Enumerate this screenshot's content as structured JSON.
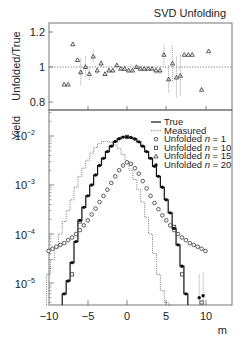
{
  "chart_data": [
    {
      "type": "scatter",
      "panel": "ratio",
      "title": "SVD Unfolding",
      "xlabel": "",
      "ylabel": "Unfolded/True",
      "ylim": [
        0.75,
        1.25
      ],
      "xlim": [
        -10,
        13.3
      ],
      "yticks": [
        "0.8",
        "1",
        "1.2"
      ],
      "reference_line": 1.0,
      "series": [
        {
          "name": "Unfolded n = 15 / True",
          "marker": "triangle",
          "x": [
            -8.0,
            -7.5,
            -6.9,
            -6.3,
            -5.9,
            -5.3,
            -4.8,
            -4.3,
            -3.8,
            -3.3,
            -2.8,
            -2.3,
            -1.8,
            -1.3,
            -0.8,
            -0.3,
            0.2,
            0.7,
            1.2,
            1.7,
            2.2,
            2.7,
            3.2,
            3.7,
            4.2,
            4.7,
            5.3,
            5.8,
            6.3,
            6.8,
            7.3,
            7.8,
            8.3,
            9.5,
            10.4
          ],
          "y": [
            0.9,
            0.9,
            1.13,
            1.04,
            0.97,
            1.0,
            0.96,
            1.06,
            0.98,
            1.02,
            0.96,
            0.98,
            0.98,
            1.01,
            0.99,
            0.99,
            0.98,
            0.98,
            1.0,
            0.99,
            0.99,
            0.99,
            0.99,
            0.98,
            0.98,
            1.07,
            0.93,
            1.02,
            0.94,
            0.95,
            1.07,
            1.07,
            1.07,
            0.87,
            1.09
          ],
          "err": [
            0,
            0,
            0,
            0,
            0.08,
            0.06,
            0.04,
            0.04,
            0.02,
            0.02,
            0.01,
            0.01,
            0.01,
            0.01,
            0.01,
            0.01,
            0.01,
            0.01,
            0.01,
            0.01,
            0.01,
            0.01,
            0.01,
            0.02,
            0.02,
            0.06,
            0.08,
            0.1,
            0.12,
            0.12,
            0,
            0,
            0,
            0,
            0
          ]
        }
      ]
    },
    {
      "type": "line",
      "panel": "yield",
      "title": "",
      "xlabel": "m",
      "ylabel": "Yield",
      "yscale": "log",
      "ylim": [
        3e-06,
        0.03
      ],
      "xlim": [
        -10,
        13.3
      ],
      "xticks": [
        "−10",
        "−5",
        "0",
        "5",
        "10"
      ],
      "yticks": [
        "10^-5",
        "10^-4",
        "10^-3",
        "10^-2"
      ],
      "legend_position": "upper right",
      "series": [
        {
          "name": "True",
          "style": "solid-step",
          "x": [
            -8.0,
            -7.5,
            -7.0,
            -6.5,
            -6.0,
            -5.5,
            -5.0,
            -4.5,
            -4.0,
            -3.5,
            -3.0,
            -2.5,
            -2.0,
            -1.5,
            -1.0,
            -0.5,
            0.0,
            0.5,
            1.0,
            1.5,
            2.0,
            2.5,
            3.0,
            3.5,
            4.0,
            4.5,
            5.0,
            5.5,
            6.0,
            6.5,
            7.0,
            7.5
          ],
          "values": [
            6e-06,
            1.1e-05,
            2.6e-05,
            7e-05,
            0.00019,
            0.00035,
            0.0006,
            0.001,
            0.0016,
            0.0025,
            0.0035,
            0.0048,
            0.0062,
            0.0077,
            0.0088,
            0.0095,
            0.0096,
            0.0093,
            0.0087,
            0.0076,
            0.0062,
            0.0048,
            0.0035,
            0.0024,
            0.0015,
            0.0009,
            0.0005,
            0.00027,
            0.00013,
            6e-05,
            2.2e-05,
            6e-06
          ]
        },
        {
          "name": "Measured",
          "style": "dotted-step",
          "x": [
            -10.0,
            -9.5,
            -9.0,
            -8.5,
            -8.0,
            -7.5,
            -7.0,
            -6.5,
            -6.0,
            -5.5,
            -5.0,
            -4.5,
            -4.0,
            -3.5,
            -3.0,
            -2.5,
            -2.0,
            -1.5,
            -1.0,
            -0.5,
            0.0,
            0.5,
            1.0,
            1.5,
            2.0,
            2.5,
            3.0,
            3.5,
            4.0,
            4.5,
            5.0,
            5.5
          ],
          "values": [
            1.5e-05,
            3e-05,
            5e-05,
            0.0001,
            0.00018,
            0.0003,
            0.0005,
            0.0009,
            0.0015,
            0.0022,
            0.0032,
            0.0045,
            0.0058,
            0.007,
            0.0077,
            0.0078,
            0.0074,
            0.0066,
            0.0055,
            0.0042,
            0.003,
            0.002,
            0.0013,
            0.0008,
            0.00045,
            0.00022,
            0.0001,
            4e-05,
            1.5e-05,
            7e-06,
            4e-06,
            3e-06
          ]
        },
        {
          "name": "Unfolded n = 1",
          "marker": "open-circle",
          "x": [
            -10.0,
            -9.5,
            -9.0,
            -8.5,
            -8.0,
            -7.5,
            -7.0,
            -6.5,
            -6.0,
            -5.5,
            -5.0,
            -4.5,
            -4.0,
            -3.5,
            -3.0,
            -2.5,
            -2.0,
            -1.5,
            -1.0,
            -0.5,
            0.0,
            0.5,
            1.0,
            1.5,
            2.0,
            2.5,
            3.0,
            3.5,
            4.0,
            4.5,
            5.0,
            5.5,
            6.0,
            6.5,
            7.0,
            7.5,
            8.0,
            8.5,
            9.0,
            9.5,
            10.0
          ],
          "values": [
            4.5e-05,
            5e-05,
            5.5e-05,
            6e-05,
            6.5e-05,
            7.5e-05,
            8.5e-05,
            0.0001,
            0.00012,
            0.00015,
            0.00019,
            0.00025,
            0.00033,
            0.00045,
            0.0006,
            0.0008,
            0.0011,
            0.0015,
            0.002,
            0.0025,
            0.0029,
            0.0027,
            0.0022,
            0.0017,
            0.0012,
            0.00085,
            0.0006,
            0.00043,
            0.00032,
            0.00024,
            0.00019,
            0.00015,
            0.00012,
            0.0001,
            8.5e-05,
            7.5e-05,
            6.5e-05,
            6e-05,
            5.5e-05,
            5e-05,
            4.5e-05
          ]
        },
        {
          "name": "Unfolded n = 10",
          "marker": "open-square",
          "x": [
            -7.0,
            -6.0,
            0.0,
            6.0,
            7.0,
            9.5
          ],
          "values": [
            1.5e-05,
            0.00018,
            0.0096,
            0.00014,
            1.5e-05,
            4e-06
          ]
        },
        {
          "name": "Unfolded n = 15",
          "marker": "triangle",
          "x": [
            0.0
          ],
          "values": [
            0.0096
          ]
        },
        {
          "name": "Unfolded n = 20",
          "marker": "filled-circle",
          "x": [
            -8.0,
            -7.5,
            -7.0,
            -6.5,
            -6.0,
            -5.5,
            -5.0,
            -4.5,
            -4.0,
            -3.5,
            -3.0,
            -2.5,
            -2.0,
            -1.5,
            -1.0,
            -0.5,
            0.0,
            0.5,
            1.0,
            1.5,
            2.0,
            2.5,
            3.0,
            3.5,
            4.0,
            4.5,
            5.0,
            5.5,
            6.0,
            6.5,
            7.0,
            7.5,
            9.2,
            9.7
          ],
          "values": [
            6e-06,
            1.1e-05,
            2.6e-05,
            7e-05,
            0.00019,
            0.00035,
            0.0006,
            0.001,
            0.0016,
            0.0025,
            0.0035,
            0.0048,
            0.0062,
            0.0077,
            0.0088,
            0.0095,
            0.0096,
            0.0093,
            0.0087,
            0.0076,
            0.0062,
            0.0048,
            0.0035,
            0.0024,
            0.0015,
            0.0009,
            0.0005,
            0.00027,
            0.00013,
            6e-05,
            2.2e-05,
            6e-06,
            5e-06,
            5.5e-06
          ]
        }
      ]
    }
  ],
  "labels": {
    "title": "SVD Unfolding",
    "ratio_ylabel": "Unfolded/True",
    "yield_ylabel": "Yield",
    "xlabel": "m",
    "ratio_yticks": [
      "1.2",
      "1",
      "0.8"
    ],
    "xticks": [
      "−10",
      "−5",
      "0",
      "5",
      "10"
    ],
    "yield_yticks": [
      "10",
      "10",
      "10",
      "10"
    ],
    "yield_exponents": [
      "−2",
      "−3",
      "−4",
      "−5"
    ]
  },
  "legend": [
    {
      "symbol": "solid-line",
      "label": "True"
    },
    {
      "symbol": "dotted-line",
      "label": "Measured"
    },
    {
      "symbol": "open-circle",
      "label": "Unfolded ",
      "n": "n",
      "eq": " = 1"
    },
    {
      "symbol": "open-square",
      "label": "Unfolded ",
      "n": "n",
      "eq": " = 10"
    },
    {
      "symbol": "triangle",
      "label": "Unfolded ",
      "n": "n",
      "eq": " = 15"
    },
    {
      "symbol": "filled-circle",
      "label": "Unfolded ",
      "n": "n",
      "eq": " = 20"
    }
  ]
}
